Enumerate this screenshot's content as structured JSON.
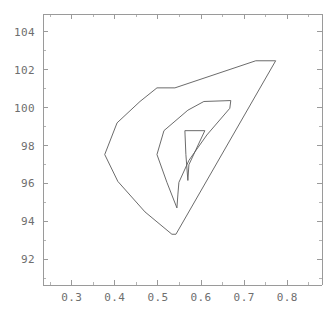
{
  "chart_data": {
    "type": "line",
    "title": "",
    "subtitle": "",
    "xlabel": "",
    "ylabel": "",
    "xlim": [
      0.2333,
      0.8806
    ],
    "ylim": [
      90.64,
      104.95
    ],
    "grid": false,
    "legend": null,
    "annotations": [],
    "xticks": [
      0.3,
      0.4,
      0.5,
      0.6,
      0.7,
      0.8
    ],
    "xticklabels": [
      "0.3",
      "0.4",
      "0.5",
      "0.6",
      "0.7",
      "0.8"
    ],
    "yticks": [
      92,
      94,
      96,
      98,
      100,
      102,
      104
    ],
    "yticklabels": [
      "92",
      "94",
      "96",
      "98",
      "100",
      "102",
      "104"
    ],
    "xtick_minor": [
      0.25,
      0.35,
      0.45,
      0.55,
      0.65,
      0.75,
      0.85
    ],
    "ytick_minor": [
      91,
      93,
      95,
      97,
      99,
      101,
      103
    ],
    "series": [
      {
        "name": "outer-contour",
        "closed": true,
        "points": [
          [
            0.3765,
            97.53
          ],
          [
            0.4069,
            96.11
          ],
          [
            0.4699,
            94.5
          ],
          [
            0.5324,
            93.32
          ],
          [
            0.5417,
            93.32
          ],
          [
            0.7731,
            102.48
          ],
          [
            0.7269,
            102.48
          ],
          [
            0.5394,
            101.05
          ],
          [
            0.4977,
            101.05
          ],
          [
            0.4583,
            100.33
          ],
          [
            0.4051,
            99.2
          ],
          [
            0.3765,
            97.53
          ]
        ]
      },
      {
        "name": "middle-contour",
        "closed": true,
        "points": [
          [
            0.4977,
            97.53
          ],
          [
            0.5139,
            98.79
          ],
          [
            0.5694,
            99.87
          ],
          [
            0.6065,
            100.33
          ],
          [
            0.669,
            100.38
          ],
          [
            0.6667,
            99.97
          ],
          [
            0.6134,
            98.56
          ],
          [
            0.5718,
            97.22
          ],
          [
            0.5486,
            96.06
          ],
          [
            0.5463,
            95.44
          ],
          [
            0.544,
            94.71
          ],
          [
            0.5208,
            96.06
          ],
          [
            0.4977,
            97.53
          ]
        ]
      },
      {
        "name": "inner-contour",
        "closed": true,
        "points": [
          [
            0.5625,
            98.79
          ],
          [
            0.6088,
            98.79
          ],
          [
            0.588,
            97.78
          ],
          [
            0.5718,
            96.99
          ],
          [
            0.5694,
            96.16
          ],
          [
            0.5648,
            97.53
          ],
          [
            0.5625,
            98.79
          ]
        ]
      }
    ]
  },
  "figure": {
    "name": "contour-plot",
    "background_color": "#ffffff",
    "axis_color": "#9a9a9a",
    "contour_color": "#5a5a5a",
    "label_color": "#6e6e6e",
    "frame_px": {
      "left": 43,
      "right": 322,
      "top": 14,
      "bottom": 285
    }
  }
}
